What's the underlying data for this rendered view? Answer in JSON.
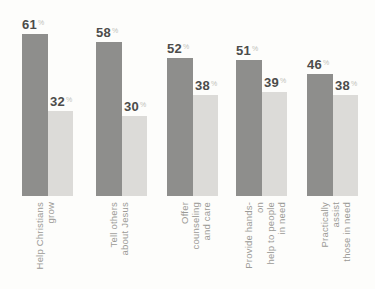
{
  "chart_data": {
    "type": "bar",
    "orientation": "vertical",
    "grouped": true,
    "categories": [
      "Help Christians grow",
      "Tell others about Jesus",
      "Offer counseling and care",
      "Provide hands-on help to people in need",
      "Practically assist those in need"
    ],
    "category_lines": [
      [
        "Help Christians",
        "grow"
      ],
      [
        "Tell others",
        "about Jesus"
      ],
      [
        "Offer counseling",
        "and care"
      ],
      [
        "Provide hands-on",
        "help to people",
        "in need"
      ],
      [
        "Practically assist",
        "those in need"
      ]
    ],
    "series": [
      {
        "name": "primary",
        "values": [
          61,
          58,
          52,
          51,
          46
        ],
        "color": "#8e8e8c"
      },
      {
        "name": "secondary",
        "values": [
          32,
          30,
          38,
          39,
          38
        ],
        "color": "#dcdbd8"
      }
    ],
    "value_suffix": "%",
    "title": "",
    "xlabel": "",
    "ylabel": "",
    "ylim": [
      0,
      65
    ],
    "grid": false,
    "legend": false,
    "value_labels_shown": true
  },
  "colors": {
    "background": "#fdfdfb",
    "bar_primary": "#8e8e8c",
    "bar_secondary": "#dcdbd8",
    "value_number": "#4c4c4a",
    "value_percent_sign": "#c0beb8",
    "category_text": "#9b9a96"
  }
}
